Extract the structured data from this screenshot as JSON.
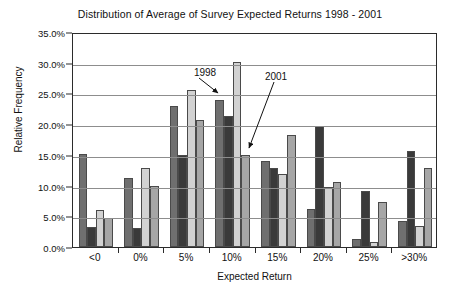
{
  "chart_data": {
    "type": "bar",
    "title": "Distribution of Average of Survey Expected Returns 1998 - 2001",
    "xlabel": "Expected Return",
    "ylabel": "Relative Frequency",
    "categories": [
      "<0",
      "0%",
      "5%",
      "10%",
      "15%",
      "20%",
      "25%",
      ">30%"
    ],
    "ylim": [
      0,
      35
    ],
    "yticks": [
      "0.0%",
      "5.0%",
      "10.0%",
      "15.0%",
      "20.0%",
      "25.0%",
      "30.0%",
      "35.0%"
    ],
    "ytick_values": [
      0,
      5,
      10,
      15,
      20,
      25,
      30,
      35
    ],
    "grid": "horizontal",
    "legend": "none",
    "series": [
      {
        "name": "1998",
        "color": "#6f6f6f",
        "values": [
          15.2,
          11.2,
          23.0,
          24.0,
          14.0,
          6.2,
          1.3,
          4.3
        ]
      },
      {
        "name": "1999",
        "color": "#3a3a3a",
        "values": [
          3.2,
          3.1,
          15.0,
          21.3,
          12.9,
          19.7,
          9.1,
          15.7
        ]
      },
      {
        "name": "2000",
        "color": "#d2d2d2",
        "values": [
          6.0,
          12.8,
          25.6,
          30.2,
          11.9,
          9.7,
          0.8,
          3.5
        ]
      },
      {
        "name": "2001",
        "color": "#a6a6a6",
        "values": [
          4.7,
          10.0,
          20.7,
          15.0,
          18.3,
          10.6,
          7.3,
          12.8
        ]
      }
    ],
    "annotations": [
      {
        "label": "1998",
        "text_x": 205,
        "text_y": 72,
        "arrow_from_x": 199,
        "arrow_from_y": 78,
        "arrow_to_x": 218,
        "arrow_to_y": 93
      },
      {
        "label": "2001",
        "text_x": 276,
        "text_y": 76,
        "arrow_from_x": 274,
        "arrow_from_y": 82,
        "arrow_to_x": 249,
        "arrow_to_y": 148
      }
    ]
  }
}
